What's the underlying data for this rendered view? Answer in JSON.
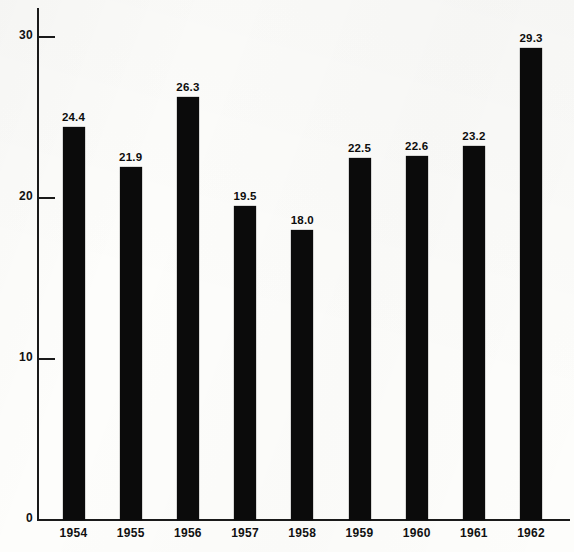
{
  "chart_data": {
    "type": "bar",
    "title": "",
    "xlabel": "",
    "ylabel": "",
    "categories": [
      "1954",
      "1955",
      "1956",
      "1957",
      "1958",
      "1959",
      "1960",
      "1961",
      "1962"
    ],
    "values": [
      24.4,
      21.9,
      26.3,
      19.5,
      18.0,
      22.5,
      22.6,
      23.2,
      29.3
    ],
    "value_labels": [
      "24.4",
      "21.9",
      "26.3",
      "19.5",
      "18.0",
      "22.5",
      "22.6",
      "23.2",
      "29.3"
    ],
    "ylim": [
      0,
      31
    ],
    "y_ticks": [
      0,
      10,
      20,
      30
    ],
    "y_tick_labels": [
      "0",
      "10",
      "20",
      "30"
    ],
    "grid": false,
    "legend": null,
    "bar_color": "#0b0b0b",
    "background_color": "#fdfdfb",
    "axis_color": "#1a1a1a"
  }
}
